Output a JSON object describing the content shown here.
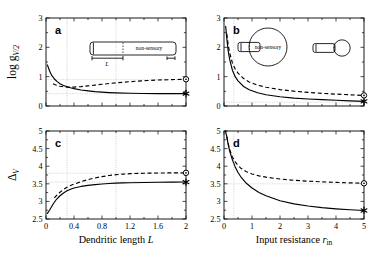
{
  "figure": {
    "background": "#ffffff",
    "line_color": "#000000",
    "guide_color": "#bdbdbd"
  },
  "axes": {
    "left_x_title_main": "Dendritic length",
    "left_x_title_sym": "L",
    "right_x_title_main": "Input resistance",
    "right_x_title_sym": "r",
    "right_x_title_sub": "in",
    "top_y_label_main": "log g",
    "top_y_label_sub": "V/2",
    "bottom_y_label_main": "Δ",
    "bottom_y_label_sub": "V"
  },
  "insets": {
    "cable_label": "non-sensory",
    "cable_length_symbol": "L",
    "soma_label": "non-sensory"
  },
  "markers": {
    "circle_name": "open-circle-marker",
    "star_name": "asterisk-marker"
  },
  "chart_data": [
    {
      "id": "a",
      "panel_letter": "a",
      "type": "line",
      "title": "",
      "xlabel": "Dendritic length L",
      "ylabel": "log g_V/2",
      "xlim": [
        0,
        2
      ],
      "ylim": [
        0,
        3
      ],
      "xticks": [
        0,
        0.4,
        0.8,
        1.2,
        1.6,
        2
      ],
      "xticklabels": [
        "0",
        "0.4",
        "0.8",
        "1.2",
        "1.6",
        "2"
      ],
      "yticks": [
        0,
        1,
        2,
        3
      ],
      "yticklabels": [
        "0",
        "1",
        "2",
        "3"
      ],
      "grid": false,
      "guides_v": [
        0.3,
        1.0
      ],
      "guides_h": [
        0.42,
        0.9
      ],
      "legend": "none",
      "series": [
        {
          "name": "sensory (solid)",
          "style": "solid",
          "end_marker": "asterisk",
          "x": [
            0.02,
            0.05,
            0.08,
            0.12,
            0.16,
            0.2,
            0.25,
            0.3,
            0.35,
            0.4,
            0.5,
            0.6,
            0.7,
            0.8,
            0.9,
            1.0,
            1.2,
            1.4,
            1.6,
            1.8,
            2.0
          ],
          "y": [
            1.4,
            1.2,
            1.05,
            0.92,
            0.83,
            0.76,
            0.7,
            0.655,
            0.62,
            0.59,
            0.545,
            0.515,
            0.49,
            0.472,
            0.458,
            0.448,
            0.435,
            0.428,
            0.424,
            0.422,
            0.421
          ]
        },
        {
          "name": "non-sensory (dashed)",
          "style": "dashed",
          "end_marker": "circle",
          "x": [
            0.1,
            0.15,
            0.2,
            0.25,
            0.3,
            0.35,
            0.4,
            0.5,
            0.6,
            0.7,
            0.8,
            0.9,
            1.0,
            1.2,
            1.4,
            1.6,
            1.8,
            2.0
          ],
          "y": [
            0.76,
            0.71,
            0.675,
            0.655,
            0.645,
            0.642,
            0.645,
            0.662,
            0.685,
            0.712,
            0.74,
            0.766,
            0.79,
            0.83,
            0.862,
            0.885,
            0.9,
            0.912
          ]
        }
      ]
    },
    {
      "id": "b",
      "panel_letter": "b",
      "type": "line",
      "title": "",
      "xlabel": "Input resistance r_in",
      "ylabel": "log g_V/2",
      "xlim": [
        0,
        5
      ],
      "ylim": [
        0,
        3
      ],
      "xticks": [
        0,
        1,
        2,
        3,
        4,
        5
      ],
      "xticklabels": [
        "0",
        "1",
        "2",
        "3",
        "4",
        "5"
      ],
      "yticks": [
        0,
        1,
        2,
        3
      ],
      "yticklabels": [
        "0",
        "1",
        "2",
        "3"
      ],
      "grid": false,
      "guides_v": [
        0.35
      ],
      "guides_h": [
        0.13
      ],
      "legend": "none",
      "series": [
        {
          "name": "sensory (solid)",
          "style": "solid",
          "end_marker": "asterisk",
          "x": [
            0.06,
            0.1,
            0.15,
            0.2,
            0.3,
            0.4,
            0.5,
            0.7,
            0.9,
            1.2,
            1.5,
            2.0,
            2.5,
            3.0,
            3.5,
            4.0,
            4.5,
            5.0
          ],
          "y": [
            2.72,
            2.3,
            1.88,
            1.6,
            1.22,
            1.0,
            0.855,
            0.665,
            0.555,
            0.45,
            0.385,
            0.315,
            0.27,
            0.24,
            0.215,
            0.195,
            0.175,
            0.16
          ]
        },
        {
          "name": "non-sensory (dashed)",
          "style": "dashed",
          "end_marker": "circle",
          "x": [
            0.1,
            0.15,
            0.2,
            0.3,
            0.4,
            0.5,
            0.7,
            0.9,
            1.2,
            1.5,
            2.0,
            2.5,
            3.0,
            3.5,
            4.0,
            4.5,
            5.0
          ],
          "y": [
            2.46,
            2.08,
            1.82,
            1.47,
            1.26,
            1.12,
            0.935,
            0.82,
            0.71,
            0.64,
            0.56,
            0.505,
            0.465,
            0.432,
            0.405,
            0.382,
            0.36
          ]
        }
      ]
    },
    {
      "id": "c",
      "panel_letter": "c",
      "type": "line",
      "title": "",
      "xlabel": "Dendritic length L",
      "ylabel": "Δ_V",
      "xlim": [
        0,
        2
      ],
      "ylim": [
        2.5,
        5
      ],
      "xticks": [
        0,
        0.4,
        0.8,
        1.2,
        1.6,
        2
      ],
      "xticklabels": [
        "0",
        "0.4",
        "0.8",
        "1.2",
        "1.6",
        "2"
      ],
      "yticks": [
        2.5,
        3,
        3.5,
        4,
        4.5,
        5
      ],
      "yticklabels": [
        "2.5",
        "3",
        "3.5",
        "4",
        "4.5",
        "5"
      ],
      "grid": false,
      "guides_v": [
        0.3,
        1.0
      ],
      "guides_h": [
        3.55,
        3.8
      ],
      "legend": "none",
      "series": [
        {
          "name": "sensory (solid)",
          "style": "solid",
          "end_marker": "asterisk",
          "x": [
            0.02,
            0.05,
            0.1,
            0.15,
            0.2,
            0.25,
            0.3,
            0.35,
            0.4,
            0.5,
            0.6,
            0.7,
            0.8,
            0.9,
            1.0,
            1.1,
            1.2,
            1.4,
            1.6,
            1.8,
            2.0
          ],
          "y": [
            2.66,
            2.75,
            2.92,
            3.06,
            3.16,
            3.24,
            3.3,
            3.345,
            3.38,
            3.425,
            3.455,
            3.478,
            3.495,
            3.508,
            3.518,
            3.525,
            3.53,
            3.538,
            3.543,
            3.547,
            3.55
          ]
        },
        {
          "name": "non-sensory (dashed)",
          "style": "dashed",
          "end_marker": "circle",
          "x": [
            0.12,
            0.16,
            0.2,
            0.25,
            0.3,
            0.35,
            0.4,
            0.5,
            0.6,
            0.7,
            0.8,
            0.9,
            1.0,
            1.1,
            1.2,
            1.4,
            1.6,
            1.8,
            2.0
          ],
          "y": [
            3.1,
            3.19,
            3.26,
            3.34,
            3.4,
            3.45,
            3.49,
            3.56,
            3.62,
            3.665,
            3.705,
            3.735,
            3.76,
            3.775,
            3.788,
            3.8,
            3.806,
            3.81,
            3.812
          ]
        }
      ]
    },
    {
      "id": "d",
      "panel_letter": "d",
      "type": "line",
      "title": "",
      "xlabel": "Input resistance r_in",
      "ylabel": "Δ_V",
      "xlim": [
        0,
        5
      ],
      "ylim": [
        2.5,
        5
      ],
      "xticks": [
        0,
        1,
        2,
        3,
        4,
        5
      ],
      "xticklabels": [
        "0",
        "1",
        "2",
        "3",
        "4",
        "5"
      ],
      "yticks": [
        2.5,
        3,
        3.5,
        4,
        4.5,
        5
      ],
      "yticklabels": [
        "2.5",
        "3",
        "3.5",
        "4",
        "4.5",
        "5"
      ],
      "grid": false,
      "guides_v": [
        0.35
      ],
      "guides_h": [
        3.5
      ],
      "legend": "none",
      "series": [
        {
          "name": "sensory (solid)",
          "style": "solid",
          "end_marker": "asterisk",
          "x": [
            0.05,
            0.1,
            0.15,
            0.2,
            0.3,
            0.4,
            0.5,
            0.6,
            0.8,
            1.0,
            1.25,
            1.5,
            2.0,
            2.5,
            3.0,
            3.5,
            4.0,
            4.5,
            5.0
          ],
          "y": [
            5.0,
            4.84,
            4.62,
            4.44,
            4.18,
            3.98,
            3.82,
            3.7,
            3.515,
            3.38,
            3.255,
            3.16,
            3.02,
            2.93,
            2.868,
            2.822,
            2.788,
            2.762,
            2.742
          ]
        },
        {
          "name": "non-sensory (dashed)",
          "style": "dashed",
          "end_marker": "circle",
          "x": [
            0.1,
            0.15,
            0.2,
            0.3,
            0.4,
            0.5,
            0.6,
            0.8,
            1.0,
            1.25,
            1.5,
            2.0,
            2.5,
            3.0,
            3.5,
            4.0,
            4.5,
            5.0
          ],
          "y": [
            4.84,
            4.64,
            4.48,
            4.26,
            4.12,
            4.02,
            3.945,
            3.845,
            3.78,
            3.725,
            3.688,
            3.635,
            3.6,
            3.575,
            3.556,
            3.54,
            3.527,
            3.515
          ]
        }
      ]
    }
  ]
}
